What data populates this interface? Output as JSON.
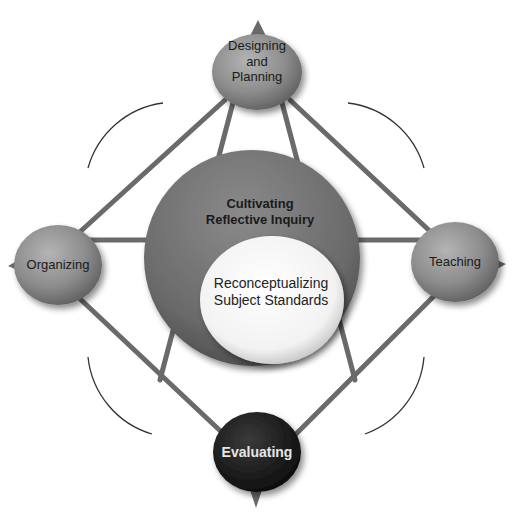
{
  "nodes": {
    "top": {
      "label_lines": [
        "Designing",
        "and",
        "Planning"
      ],
      "fill": "#8a8a8a"
    },
    "left": {
      "label": "Organizing",
      "fill": "#8a8a8a"
    },
    "right": {
      "label": "Teaching",
      "fill": "#8a8a8a"
    },
    "bottom": {
      "label": "Evaluating",
      "fill": "#1c1c1c",
      "text_color": "#e6e6e6"
    }
  },
  "center": {
    "outer": {
      "label_lines": [
        "Cultivating",
        "Reflective Inquiry"
      ],
      "fill": "#6e6e6e"
    },
    "inner": {
      "label_lines": [
        "Reconceptualizing",
        "Subject Standards"
      ],
      "fill": "#f4f4f4"
    }
  },
  "colors": {
    "connector": "#6a6a6a",
    "arc": "#333333"
  }
}
